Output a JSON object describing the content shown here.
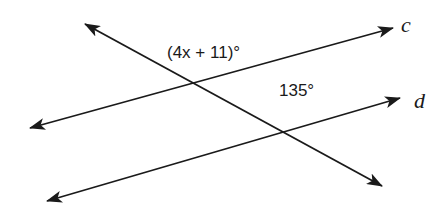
{
  "diagram": {
    "type": "parallel-lines-transversal",
    "lines": [
      {
        "name": "c",
        "label": "c",
        "from": [
          30,
          128
        ],
        "to": [
          393,
          28
        ]
      },
      {
        "name": "d",
        "label": "d",
        "from": [
          47,
          201
        ],
        "to": [
          400,
          98
        ]
      },
      {
        "name": "transversal",
        "label": "",
        "from": [
          85,
          24
        ],
        "to": [
          382,
          186
        ]
      }
    ],
    "angles": [
      {
        "label": "(4x + 11)°",
        "at_intersection": "transversal-c",
        "position": "above"
      },
      {
        "label": "135°",
        "at_intersection": "transversal-d",
        "position": "above"
      }
    ],
    "line_color": "#1a1a1a"
  },
  "labels": {
    "line_c": "c",
    "line_d": "d",
    "angle_top": "(4x + 11)°",
    "angle_bottom": "135°"
  }
}
